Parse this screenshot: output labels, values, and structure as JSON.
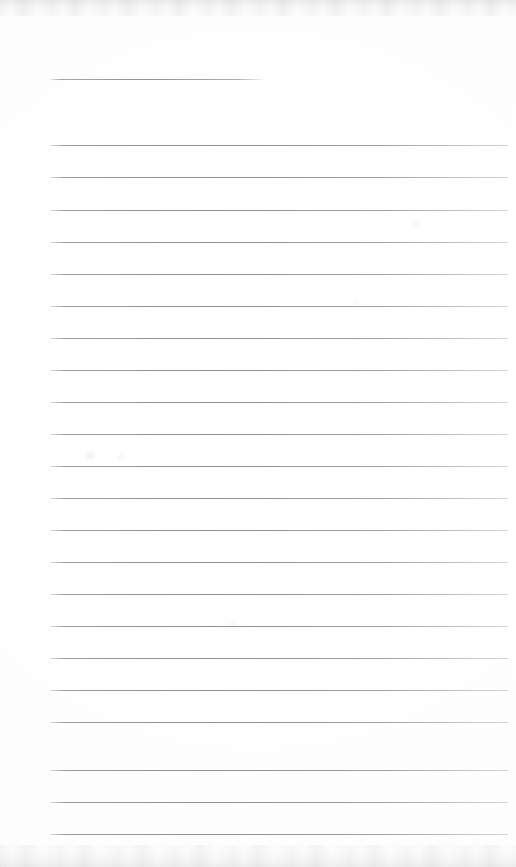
{
  "document": {
    "kind": "scanned-ruled-page",
    "title": "Blank ruled writing page (scan)",
    "page_width": 516,
    "page_height": 867,
    "background_color": "#ffffff",
    "rule_color": "#8e8e96",
    "content_text": "",
    "has_handwriting": false,
    "has_printed_text": false
  },
  "layout": {
    "left_margin_x": 50,
    "right_margin_x": 508,
    "header_rule_right_x": 263,
    "first_rule_y": 79,
    "body_first_rule_y": 145,
    "rule_spacing": 31.8,
    "rule_count": 23,
    "body_rule_count": 22
  },
  "rules": [
    {
      "name": "header-rule",
      "y": 79,
      "x1": 50,
      "x2": 263,
      "full_width": false
    },
    {
      "name": "body-rule-1",
      "y": 145,
      "x1": 50,
      "x2": 508,
      "full_width": true
    },
    {
      "name": "body-rule-2",
      "y": 177,
      "x1": 50,
      "x2": 508,
      "full_width": true
    },
    {
      "name": "body-rule-3",
      "y": 210,
      "x1": 50,
      "x2": 508,
      "full_width": true
    },
    {
      "name": "body-rule-4",
      "y": 242,
      "x1": 50,
      "x2": 508,
      "full_width": true
    },
    {
      "name": "body-rule-5",
      "y": 274,
      "x1": 50,
      "x2": 508,
      "full_width": true
    },
    {
      "name": "body-rule-6",
      "y": 306,
      "x1": 50,
      "x2": 508,
      "full_width": true
    },
    {
      "name": "body-rule-7",
      "y": 338,
      "x1": 50,
      "x2": 508,
      "full_width": true
    },
    {
      "name": "body-rule-8",
      "y": 370,
      "x1": 50,
      "x2": 508,
      "full_width": true
    },
    {
      "name": "body-rule-9",
      "y": 402,
      "x1": 50,
      "x2": 508,
      "full_width": true
    },
    {
      "name": "body-rule-10",
      "y": 434,
      "x1": 50,
      "x2": 508,
      "full_width": true
    },
    {
      "name": "body-rule-11",
      "y": 466,
      "x1": 50,
      "x2": 508,
      "full_width": true
    },
    {
      "name": "body-rule-12",
      "y": 498,
      "x1": 50,
      "x2": 508,
      "full_width": true
    },
    {
      "name": "body-rule-13",
      "y": 530,
      "x1": 50,
      "x2": 508,
      "full_width": true
    },
    {
      "name": "body-rule-14",
      "y": 562,
      "x1": 50,
      "x2": 508,
      "full_width": true
    },
    {
      "name": "body-rule-15",
      "y": 594,
      "x1": 50,
      "x2": 508,
      "full_width": true
    },
    {
      "name": "body-rule-16",
      "y": 626,
      "x1": 50,
      "x2": 508,
      "full_width": true
    },
    {
      "name": "body-rule-17",
      "y": 658,
      "x1": 50,
      "x2": 508,
      "full_width": true
    },
    {
      "name": "body-rule-18",
      "y": 690,
      "x1": 50,
      "x2": 508,
      "full_width": true
    },
    {
      "name": "body-rule-19",
      "y": 722,
      "x1": 50,
      "x2": 508,
      "full_width": true
    },
    {
      "name": "body-rule-20",
      "y": 770,
      "x1": 50,
      "x2": 508,
      "full_width": true
    },
    {
      "name": "body-rule-21",
      "y": 802,
      "x1": 50,
      "x2": 508,
      "full_width": true
    },
    {
      "name": "body-rule-22",
      "y": 834,
      "x1": 50,
      "x2": 508,
      "full_width": true
    }
  ],
  "artifacts": {
    "scan_edge_top": true,
    "scan_edge_bottom": true,
    "smudges": [
      {
        "name": "smudge-a",
        "x": 86,
        "y": 452,
        "w": 9,
        "h": 7,
        "opacity": 0.07
      },
      {
        "name": "smudge-b",
        "x": 118,
        "y": 454,
        "w": 7,
        "h": 6,
        "opacity": 0.06
      },
      {
        "name": "smudge-c",
        "x": 413,
        "y": 222,
        "w": 6,
        "h": 5,
        "opacity": 0.05
      },
      {
        "name": "smudge-d",
        "x": 226,
        "y": 622,
        "w": 11,
        "h": 5,
        "opacity": 0.04
      },
      {
        "name": "smudge-e",
        "x": 352,
        "y": 300,
        "w": 8,
        "h": 4,
        "opacity": 0.04
      }
    ]
  }
}
